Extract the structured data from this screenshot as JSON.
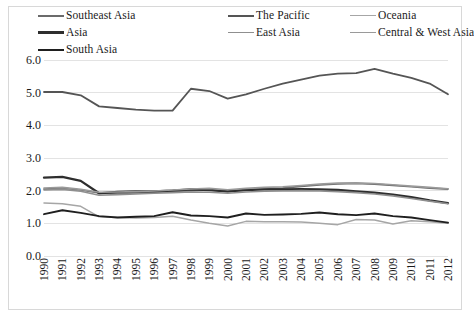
{
  "chart_data": {
    "type": "line",
    "title": "",
    "subtitle": "",
    "xlabel": "",
    "ylabel": "",
    "grid": true,
    "legend_position": "top",
    "ylim": [
      0.0,
      6.0
    ],
    "yticks": [
      "0.0",
      "1.0",
      "2.0",
      "3.0",
      "4.0",
      "5.0",
      "6.0"
    ],
    "ytick_values": [
      0.0,
      1.0,
      2.0,
      3.0,
      4.0,
      5.0,
      6.0
    ],
    "categories": [
      "1990",
      "1991",
      "1992",
      "1993",
      "1994",
      "1995",
      "1996",
      "1997",
      "1998",
      "1999",
      "2000",
      "2001",
      "2002",
      "2003",
      "2004",
      "2005",
      "2006",
      "2007",
      "2008",
      "2009",
      "2010",
      "2011",
      "2012"
    ],
    "x": [
      1990,
      1991,
      1992,
      1993,
      1994,
      1995,
      1996,
      1997,
      1998,
      1999,
      2000,
      2001,
      2002,
      2003,
      2004,
      2005,
      2006,
      2007,
      2008,
      2009,
      2010,
      2011,
      2012
    ],
    "series": [
      {
        "name": "Southeast Asia",
        "color": "#6b6b6b",
        "width": 1.7,
        "values": [
          2.05,
          2.08,
          2.02,
          1.93,
          1.92,
          1.93,
          1.95,
          1.98,
          2.0,
          2.02,
          1.97,
          2.02,
          2.06,
          2.08,
          2.13,
          2.18,
          2.21,
          2.22,
          2.2,
          2.16,
          2.12,
          2.08,
          2.05
        ]
      },
      {
        "name": "The Pacific",
        "color": "#555555",
        "width": 1.8,
        "values": [
          5.02,
          5.02,
          4.92,
          4.58,
          4.53,
          4.48,
          4.45,
          4.45,
          5.12,
          5.05,
          4.82,
          4.95,
          5.12,
          5.28,
          5.4,
          5.52,
          5.58,
          5.6,
          5.73,
          5.58,
          5.45,
          5.28,
          4.95
        ]
      },
      {
        "name": "Oceania",
        "color": "#a6a6a6",
        "width": 1.5,
        "values": [
          1.62,
          1.6,
          1.52,
          1.2,
          1.18,
          1.16,
          1.18,
          1.22,
          1.1,
          1.0,
          0.92,
          1.06,
          1.05,
          1.05,
          1.04,
          1.0,
          0.96,
          1.12,
          1.1,
          0.98,
          1.08,
          1.05,
          1.0
        ]
      },
      {
        "name": "Asia",
        "color": "#2e2e2e",
        "width": 2.3,
        "values": [
          2.4,
          2.42,
          2.3,
          1.92,
          1.96,
          1.98,
          1.98,
          2.0,
          2.04,
          2.02,
          1.98,
          2.02,
          2.04,
          2.04,
          2.05,
          2.04,
          2.02,
          1.98,
          1.94,
          1.88,
          1.8,
          1.7,
          1.62
        ]
      },
      {
        "name": "East Asia",
        "color": "#8f8f8f",
        "width": 1.6,
        "values": [
          2.02,
          2.04,
          1.98,
          1.86,
          1.88,
          1.9,
          1.92,
          1.94,
          1.96,
          1.95,
          1.92,
          1.96,
          1.98,
          1.99,
          2.0,
          1.99,
          1.97,
          1.94,
          1.9,
          1.84,
          1.76,
          1.68,
          1.6
        ]
      },
      {
        "name": "Central & West Asia",
        "color": "#9a9a9a",
        "width": 1.6,
        "values": [
          2.08,
          2.1,
          2.04,
          1.95,
          1.96,
          1.97,
          1.99,
          2.02,
          2.05,
          2.07,
          2.03,
          2.07,
          2.1,
          2.12,
          2.16,
          2.2,
          2.23,
          2.24,
          2.22,
          2.18,
          2.14,
          2.1,
          2.06
        ]
      },
      {
        "name": "South Asia",
        "color": "#1f1f1f",
        "width": 1.9,
        "values": [
          1.28,
          1.4,
          1.32,
          1.22,
          1.18,
          1.2,
          1.22,
          1.34,
          1.24,
          1.22,
          1.18,
          1.3,
          1.26,
          1.27,
          1.29,
          1.33,
          1.28,
          1.25,
          1.3,
          1.22,
          1.18,
          1.1,
          1.02
        ]
      }
    ]
  },
  "legend": {
    "items": [
      {
        "label": "Southeast Asia",
        "color": "#6b6b6b",
        "thickness": 2.0,
        "col": 0,
        "row": 0
      },
      {
        "label": "The Pacific",
        "color": "#555555",
        "thickness": 2.2,
        "col": 1,
        "row": 0
      },
      {
        "label": "Oceania",
        "color": "#a6a6a6",
        "thickness": 1.8,
        "col": 2,
        "row": 0
      },
      {
        "label": "Asia",
        "color": "#2e2e2e",
        "thickness": 3.0,
        "col": 0,
        "row": 1
      },
      {
        "label": "East Asia",
        "color": "#8f8f8f",
        "thickness": 1.8,
        "col": 1,
        "row": 1
      },
      {
        "label": "Central & West Asia",
        "color": "#9a9a9a",
        "thickness": 1.8,
        "col": 2,
        "row": 1
      },
      {
        "label": "South Asia",
        "color": "#1f1f1f",
        "thickness": 2.4,
        "col": 0,
        "row": 2
      }
    ]
  }
}
